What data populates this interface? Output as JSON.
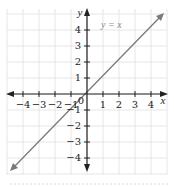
{
  "chart_data": {
    "type": "line",
    "title": "",
    "xlabel": "x",
    "ylabel": "y",
    "xlim": [
      -5,
      5
    ],
    "ylim": [
      -5,
      5
    ],
    "grid": true,
    "x_ticks": [
      -4,
      -3,
      -2,
      -1,
      1,
      2,
      3,
      4
    ],
    "y_ticks": [
      -4,
      -3,
      -2,
      -1,
      1,
      2,
      3,
      4
    ],
    "origin_label": "0",
    "series": [
      {
        "name": "y = x",
        "x": [
          -4.8,
          -4,
          -3,
          -2,
          -1,
          0,
          1,
          2,
          3,
          4,
          4.8
        ],
        "y": [
          -4.8,
          -4,
          -3,
          -2,
          -1,
          0,
          1,
          2,
          3,
          4,
          4.8
        ],
        "color": "#7a7a7a",
        "arrows_both_ends": true
      }
    ],
    "annotations": [
      {
        "text": "y = x",
        "x": 1.0,
        "y": 4.2
      }
    ]
  },
  "labels": {
    "x_axis": "x",
    "y_axis": "y",
    "origin": "0",
    "function": "y = x",
    "x_ticks": [
      "−4",
      "−3",
      "−2",
      "−1",
      "1",
      "2",
      "3",
      "4"
    ],
    "y_ticks": [
      "4",
      "3",
      "2",
      "1",
      "−1",
      "−2",
      "−3",
      "−4"
    ]
  },
  "colors": {
    "grid": "#e6e6e6",
    "axis": "#222222",
    "line": "#7a7a7a",
    "function_label": "#8a8a8a"
  }
}
